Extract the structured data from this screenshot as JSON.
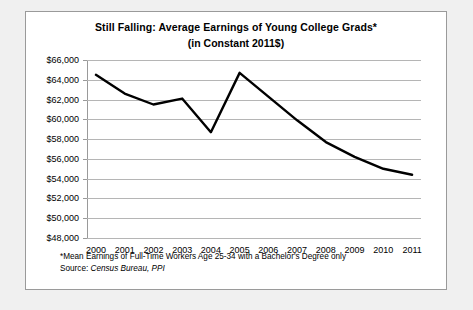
{
  "chart_data": {
    "type": "line",
    "title": "Still Falling: Average Earnings of Young College Grads*",
    "subtitle": "(in Constant 2011$)",
    "xlabel": "",
    "ylabel": "",
    "categories": [
      "2000",
      "2001",
      "2002",
      "2003",
      "2004",
      "2005",
      "2006",
      "2007",
      "2008",
      "2009",
      "2010",
      "2011"
    ],
    "values": [
      64500,
      62600,
      61500,
      62100,
      58700,
      64700,
      62300,
      59900,
      57700,
      56200,
      55000,
      54400
    ],
    "series": [
      {
        "name": "Average earnings",
        "values": [
          64500,
          62600,
          61500,
          62100,
          58700,
          64700,
          62300,
          59900,
          57700,
          56200,
          55000,
          54400
        ]
      }
    ],
    "ylim": [
      48000,
      66000
    ],
    "ytick_step": 2000,
    "ytick_labels": [
      "$66,000",
      "$64,000",
      "$62,000",
      "$60,000",
      "$58,000",
      "$56,000",
      "$54,000",
      "$52,000",
      "$50,000",
      "$48,000"
    ],
    "ytick_values": [
      66000,
      64000,
      62000,
      60000,
      58000,
      56000,
      54000,
      52000,
      50000,
      48000
    ],
    "grid": true,
    "legend": false,
    "line_color": "#000000",
    "grid_color": "#b5b5b5"
  },
  "footnote": "*Mean Earnings of Full-Time Workers Age 25-34 with a Bachelor's Degree only",
  "source": {
    "prefix": "Source: ",
    "body": "Census Bureau, PPI"
  }
}
